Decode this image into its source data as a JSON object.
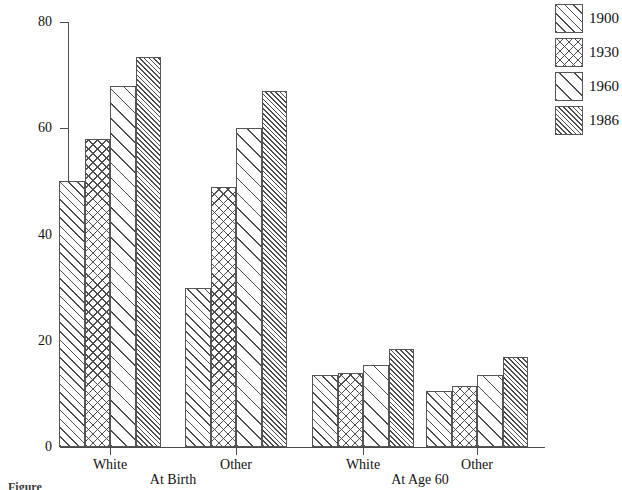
{
  "chart_data": {
    "type": "bar",
    "title": "",
    "xlabel": "",
    "ylabel": "",
    "ylim": [
      0,
      80
    ],
    "yticks": [
      0,
      20,
      40,
      60,
      80
    ],
    "ytick_labels": [
      "0",
      "20",
      "40",
      "60",
      "80"
    ],
    "grid": false,
    "legend_position": "right",
    "categories": [
      "White",
      "Other",
      "White",
      "Other"
    ],
    "group_labels": [
      "At Birth",
      "At Age 60"
    ],
    "series": [
      {
        "name": "1900",
        "pattern": "diagonal-medium",
        "values": [
          50,
          30,
          13.5,
          10.5
        ]
      },
      {
        "name": "1930",
        "pattern": "cross-hatch",
        "values": [
          58,
          49,
          14,
          11.5
        ]
      },
      {
        "name": "1960",
        "pattern": "diagonal-wide",
        "values": [
          68,
          60,
          15.5,
          13.5
        ]
      },
      {
        "name": "1986",
        "pattern": "diagonal-dense",
        "values": [
          73.5,
          67,
          18.5,
          17
        ]
      }
    ]
  },
  "legend": {
    "items": [
      {
        "label": "1900"
      },
      {
        "label": "1930"
      },
      {
        "label": "1960"
      },
      {
        "label": "1986"
      }
    ]
  },
  "axes": {
    "y_labels": [
      "80",
      "60",
      "40",
      "20",
      "0"
    ],
    "x_category_labels": [
      "White",
      "Other",
      "White",
      "Other"
    ],
    "x_group_labels": [
      "At Birth",
      "At Age 60"
    ]
  },
  "caption": {
    "text": "Figure"
  },
  "colors": {
    "hatch": "#4d4d4d",
    "outline": "#555555",
    "axis": "#4a4a4a",
    "text": "#111111",
    "background": "#ffffff"
  }
}
